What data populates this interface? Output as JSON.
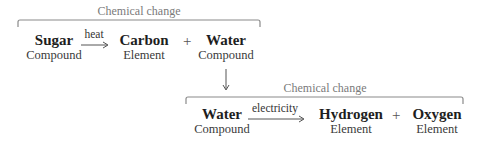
{
  "diagram": {
    "reaction1": {
      "bracket_label": "Chemical change",
      "reactant": {
        "name": "Sugar",
        "type": "Compound"
      },
      "condition": "heat",
      "products": [
        {
          "name": "Carbon",
          "type": "Element"
        },
        {
          "name": "Water",
          "type": "Compound"
        }
      ],
      "plus": "+"
    },
    "reaction2": {
      "bracket_label": "Chemical change",
      "reactant": {
        "name": "Water",
        "type": "Compound"
      },
      "condition": "electricity",
      "products": [
        {
          "name": "Hydrogen",
          "type": "Element"
        },
        {
          "name": "Oxygen",
          "type": "Element"
        }
      ],
      "plus": "+"
    },
    "colors": {
      "line": "#7d7d7d",
      "text_bold": "#1e1e1e",
      "text_label": "#7a7a7a"
    }
  }
}
